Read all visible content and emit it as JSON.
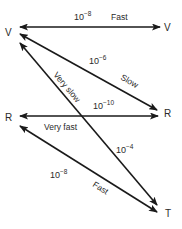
{
  "diagram": {
    "title": "",
    "colors": {
      "line": "#1a1a1a",
      "text": "#2a2a2a",
      "background": "#ffffff"
    },
    "nodes": [
      {
        "id": "V_left",
        "label": "V",
        "x": 10,
        "y": 36
      },
      {
        "id": "V_right",
        "label": "V",
        "x": 167,
        "y": 31
      },
      {
        "id": "R_left",
        "label": "R",
        "x": 10,
        "y": 121
      },
      {
        "id": "R_right",
        "label": "R",
        "x": 167,
        "y": 117
      },
      {
        "id": "T",
        "label": "T",
        "x": 168,
        "y": 217
      }
    ],
    "edges": [
      {
        "id": "v-v",
        "from": "V_left",
        "to": "V_right",
        "direction": "both",
        "rate_base": "10",
        "rate_exp": "−8",
        "speed": "Fast"
      },
      {
        "id": "v-r",
        "from": "V_left",
        "to": "R_right",
        "direction": "both",
        "rate_base": "10",
        "rate_exp": "−6",
        "speed": "Slow"
      },
      {
        "id": "r-r",
        "from": "R_left",
        "to": "R_right",
        "direction": "both",
        "rate_base": "10",
        "rate_exp": "−10",
        "speed": "Very fast"
      },
      {
        "id": "v-t",
        "from": "V_left",
        "to": "T",
        "direction": "both",
        "rate_base": "10",
        "rate_exp": "−4",
        "speed": "Very slow"
      },
      {
        "id": "r-t",
        "from": "R_left",
        "to": "T",
        "direction": "both",
        "rate_base": "10",
        "rate_exp": "−8",
        "speed": "Fast"
      }
    ]
  }
}
